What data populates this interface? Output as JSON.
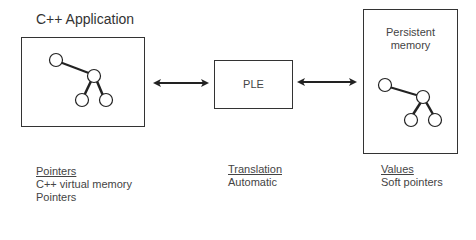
{
  "diagram": {
    "left_panel": {
      "title": "C++ Application",
      "graph": "tree-graph"
    },
    "middle_panel": {
      "label": "PLE"
    },
    "right_panel": {
      "label_line1": "Persistent",
      "label_line2": "memory",
      "graph": "tree-graph"
    },
    "connectors": [
      {
        "from": "C++ Application",
        "to": "PLE",
        "type": "bidirectional-arrow"
      },
      {
        "from": "PLE",
        "to": "Persistent memory",
        "type": "bidirectional-arrow"
      }
    ]
  },
  "legend": {
    "left": {
      "header": "Pointers",
      "lines": [
        "C++ virtual memory",
        "Pointers"
      ]
    },
    "middle": {
      "header": "Translation",
      "lines": [
        "Automatic"
      ]
    },
    "right": {
      "header": "Values",
      "lines": [
        "Soft pointers"
      ]
    }
  },
  "colors": {
    "stroke": "#333333",
    "text": "#444444",
    "background": "#ffffff"
  }
}
